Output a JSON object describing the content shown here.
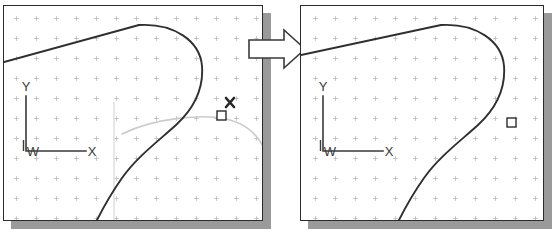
{
  "figure": {
    "background_color": "#ffffff",
    "border_color": "#2b2b2b",
    "shadow_color": "#9a9a9a",
    "grid_dot_color": "#b9b2b2",
    "geometry_color": "#2f2f2f",
    "preview_color": "#c9c9c9",
    "arrow_fill": "#ffffff",
    "arrow_stroke": "#3a3a3a"
  },
  "panels": [
    {
      "name": "before-panel",
      "label": "before",
      "ucs_icon": {
        "name": "ucs-icon",
        "y_label": "Y",
        "x_label": "X",
        "origin_label": "W"
      },
      "markers": [
        {
          "name": "pick-box",
          "kind": "square",
          "x": 220,
          "y": 114
        },
        {
          "name": "crosshair-cursor",
          "kind": "x-cursor",
          "x": 229,
          "y": 106
        }
      ],
      "preview_arc_visible": true,
      "grid_spacing": 20
    },
    {
      "name": "after-panel",
      "label": "after",
      "ucs_icon": {
        "name": "ucs-icon",
        "y_label": "Y",
        "x_label": "X",
        "origin_label": "W"
      },
      "markers": [
        {
          "name": "pick-box",
          "kind": "square",
          "x": 510,
          "y": 117
        }
      ],
      "preview_arc_visible": false,
      "grid_spacing": 20
    }
  ],
  "arrow": {
    "name": "transition-arrow",
    "direction": "right",
    "label": ""
  }
}
